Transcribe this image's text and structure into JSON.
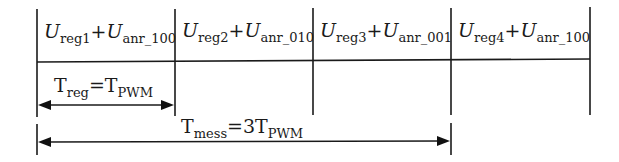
{
  "diagram": {
    "type": "timing-diagram",
    "colors": {
      "line": "#1a1a1a",
      "background": "#ffffff"
    },
    "slots": [
      {
        "index": 1,
        "main": "U",
        "main_sub": "reg1",
        "plus": "+",
        "term": "U",
        "term_sub": "anr_100"
      },
      {
        "index": 2,
        "main": "U",
        "main_sub": "reg2",
        "plus": "+",
        "term": "U",
        "term_sub": "anr_010"
      },
      {
        "index": 3,
        "main": "U",
        "main_sub": "reg3",
        "plus": "+",
        "term": "U",
        "term_sub": "anr_001"
      },
      {
        "index": 4,
        "main": "U",
        "main_sub": "reg4",
        "plus": "+",
        "term": "U",
        "term_sub": "anr_100"
      }
    ],
    "annotations": {
      "t_reg": {
        "lhs": "T",
        "lhs_sub": "reg",
        "eq": "=",
        "rhs": "T",
        "rhs_sub": "PWM",
        "span_slots": 1
      },
      "t_mess": {
        "lhs": "T",
        "lhs_sub": "mess",
        "eq": "=",
        "rhs": "3T",
        "rhs_sub": "PWM",
        "span_slots": 3
      }
    }
  }
}
